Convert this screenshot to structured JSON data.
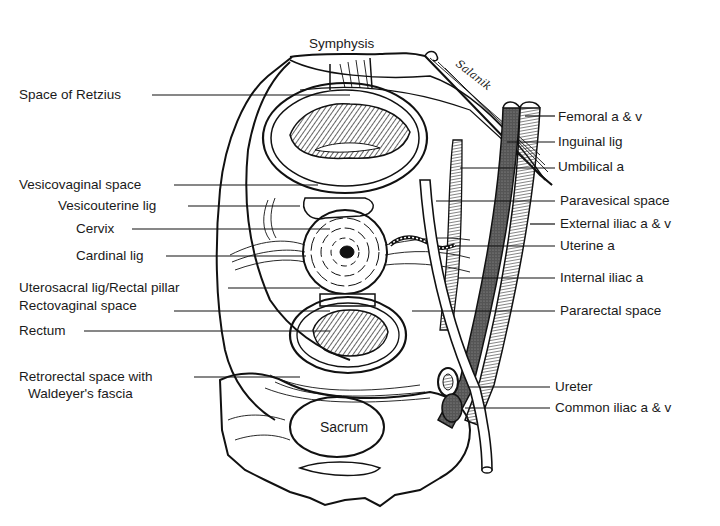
{
  "diagram": {
    "top_label": "Symphysis",
    "bottom_label": "Sacrum",
    "left_labels": [
      {
        "id": "space-of-retzius",
        "text": "Space of Retzius"
      },
      {
        "id": "vesicovaginal-space",
        "text": "Vesicovaginal space"
      },
      {
        "id": "vesicouterine-lig",
        "text": "Vesicouterine lig"
      },
      {
        "id": "cervix",
        "text": "Cervix"
      },
      {
        "id": "cardinal-lig",
        "text": "Cardinal lig"
      },
      {
        "id": "uterosacral-lig",
        "text": "Uterosacral lig/Rectal pillar"
      },
      {
        "id": "rectovaginal-space",
        "text": "Rectovaginal space"
      },
      {
        "id": "rectum",
        "text": "Rectum"
      },
      {
        "id": "retrorectal-space-1",
        "text": "Retrorectal space with"
      },
      {
        "id": "retrorectal-space-2",
        "text": "Waldeyer's fascia"
      }
    ],
    "right_labels": [
      {
        "id": "femoral",
        "text": "Femoral a & v"
      },
      {
        "id": "inguinal-lig",
        "text": "Inguinal lig"
      },
      {
        "id": "umbilical-a",
        "text": "Umbilical a"
      },
      {
        "id": "paravesical-space",
        "text": "Paravesical space"
      },
      {
        "id": "external-iliac",
        "text": "External iliac a & v"
      },
      {
        "id": "uterine-a",
        "text": "Uterine a"
      },
      {
        "id": "internal-iliac",
        "text": "Internal iliac a"
      },
      {
        "id": "pararectal-space",
        "text": "Pararectal space"
      },
      {
        "id": "ureter",
        "text": "Ureter"
      },
      {
        "id": "common-iliac",
        "text": "Common iliac a & v"
      }
    ],
    "signature": "Salanik"
  }
}
